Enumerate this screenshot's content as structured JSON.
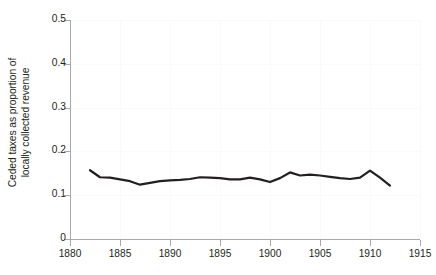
{
  "chart_data": {
    "type": "line",
    "title": "",
    "xlabel": "",
    "ylabel": "Ceded taxes as proportion of locally collected revenue",
    "ylabel_lines": [
      "Ceded taxes as proportion of",
      "locally collected revenue"
    ],
    "xlim": [
      1880,
      1915
    ],
    "ylim": [
      0,
      0.5
    ],
    "xticks": [
      1880,
      1885,
      1890,
      1895,
      1900,
      1905,
      1910,
      1915
    ],
    "xtick_labels": [
      "1880",
      "1885",
      "1890",
      "1895",
      "1900",
      "1905",
      "1910",
      "1915"
    ],
    "yticks": [
      0,
      0.1,
      0.2,
      0.3,
      0.4,
      0.5
    ],
    "ytick_labels": [
      "0",
      "0.1",
      "0.2",
      "0.3",
      "0.4",
      "0.5"
    ],
    "grid": true,
    "legend": false,
    "line_color": "#231f20",
    "line_width": 2.2,
    "series": [
      {
        "name": "Ceded taxes as proportion of locally collected revenue",
        "x": [
          1882,
          1883,
          1884,
          1885,
          1886,
          1887,
          1888,
          1889,
          1890,
          1891,
          1892,
          1893,
          1894,
          1895,
          1896,
          1897,
          1898,
          1899,
          1900,
          1901,
          1902,
          1903,
          1904,
          1905,
          1906,
          1907,
          1908,
          1909,
          1910,
          1911,
          1912
        ],
        "values": [
          0.157,
          0.141,
          0.14,
          0.136,
          0.132,
          0.124,
          0.128,
          0.132,
          0.134,
          0.135,
          0.137,
          0.141,
          0.14,
          0.139,
          0.136,
          0.136,
          0.14,
          0.136,
          0.13,
          0.139,
          0.152,
          0.145,
          0.147,
          0.145,
          0.142,
          0.139,
          0.137,
          0.14,
          0.156,
          0.14,
          0.122
        ]
      }
    ]
  },
  "axes": {
    "y_title_line1": "Ceded taxes as proportion of",
    "y_title_line2": "locally collected revenue"
  }
}
